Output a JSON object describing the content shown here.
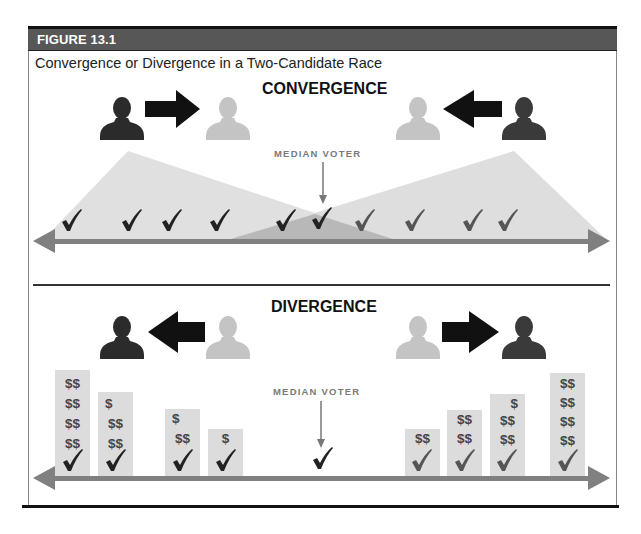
{
  "figure": {
    "label": "FIGURE 13.1",
    "title": "Convergence or Divergence in a Two-Candidate Race"
  },
  "convergence": {
    "title": "CONVERGENCE",
    "median_label": "MEDIAN VOTER",
    "left_candidate": {
      "from": "dark",
      "to": "light",
      "arrow": "right"
    },
    "right_candidate": {
      "from": "dark",
      "to": "light",
      "arrow": "left"
    },
    "voter_checkmarks": 9
  },
  "divergence": {
    "title": "DIVERGENCE",
    "median_label": "MEDIAN VOTER",
    "left_candidate": {
      "from": "light",
      "to": "dark",
      "arrow": "left"
    },
    "right_candidate": {
      "from": "light",
      "to": "dark",
      "arrow": "right"
    },
    "bars": [
      {
        "rows": [
          "$$",
          "$$",
          "$$",
          "$$"
        ]
      },
      {
        "rows": [
          "$",
          "$$",
          "$$"
        ]
      },
      {
        "rows": [
          "$",
          "$$"
        ]
      },
      {
        "rows": [
          "$"
        ]
      },
      {
        "rows": []
      },
      {
        "rows": [
          "$$"
        ]
      },
      {
        "rows": [
          "$$",
          "$$"
        ]
      },
      {
        "rows": [
          "$",
          "$$",
          "$$"
        ]
      },
      {
        "rows": [
          "$$",
          "$$",
          "$$",
          "$$"
        ]
      }
    ]
  },
  "colors": {
    "header_bg": "#575757",
    "dark_candidate": "#2b2b2b",
    "light_candidate": "#c4c4c4",
    "axis": "#7f7f7f",
    "shade": "#d9d9d9",
    "overlap": "#b5b5b5"
  },
  "icons": {
    "check": "✓",
    "person": "person-silhouette-icon",
    "arrow": "block-arrow-icon"
  }
}
